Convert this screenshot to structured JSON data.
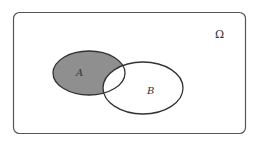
{
  "diagram": {
    "type": "venn",
    "universe": {
      "label": "Ω",
      "x": 13,
      "y": 12,
      "width": 232,
      "height": 121,
      "radius": 6
    },
    "sets": [
      {
        "id": "A",
        "label": "A",
        "cx": 89,
        "cy": 73,
        "rx": 36,
        "ry": 22,
        "label_x": 76,
        "label_y": 76
      },
      {
        "id": "B",
        "label": "B",
        "cx": 143,
        "cy": 88,
        "rx": 40,
        "ry": 26,
        "label_x": 150,
        "label_y": 94
      }
    ],
    "shaded_region": "A \\ B",
    "omega_pos": {
      "x": 219,
      "y": 37
    },
    "colors": {
      "shade": "#8f8f8f",
      "stroke": "#333333",
      "frame": "#555555",
      "background": "#ffffff"
    }
  }
}
